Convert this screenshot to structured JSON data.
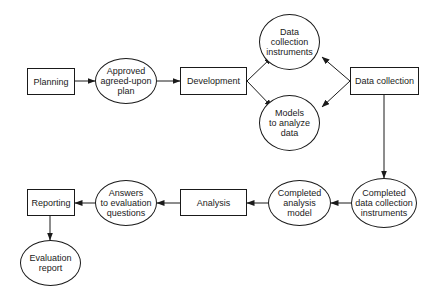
{
  "diagram": {
    "type": "flowchart",
    "colors": {
      "stroke": "#1a1a1a",
      "background": "#ffffff"
    },
    "nodes": [
      {
        "id": "planning",
        "shape": "box",
        "label": "Planning"
      },
      {
        "id": "approved_plan",
        "shape": "ellipse",
        "label": "Approved\nagreed-upon\nplan"
      },
      {
        "id": "development",
        "shape": "box",
        "label": "Development"
      },
      {
        "id": "data_instruments",
        "shape": "ellipse",
        "label": "Data\ncollection\ninstruments"
      },
      {
        "id": "models",
        "shape": "ellipse",
        "label": "Models\nto analyze\ndata"
      },
      {
        "id": "data_collection",
        "shape": "box",
        "label": "Data collection"
      },
      {
        "id": "completed_instruments",
        "shape": "ellipse",
        "label": "Completed\ndata collection\ninstruments"
      },
      {
        "id": "completed_model",
        "shape": "ellipse",
        "label": "Completed\nanalysis\nmodel"
      },
      {
        "id": "analysis",
        "shape": "box",
        "label": "Analysis"
      },
      {
        "id": "answers",
        "shape": "ellipse",
        "label": "Answers\nto evaluation\nquestions"
      },
      {
        "id": "reporting",
        "shape": "box",
        "label": "Reporting"
      },
      {
        "id": "evaluation_report",
        "shape": "ellipse",
        "label": "Evaluation\nreport"
      }
    ],
    "edges": [
      {
        "from": "planning",
        "to": "approved_plan"
      },
      {
        "from": "approved_plan",
        "to": "development"
      },
      {
        "from": "development",
        "to": "data_instruments"
      },
      {
        "from": "development",
        "to": "models"
      },
      {
        "from": "data_collection",
        "to": "data_instruments"
      },
      {
        "from": "data_collection",
        "to": "models"
      },
      {
        "from": "data_collection",
        "to": "completed_instruments"
      },
      {
        "from": "completed_instruments",
        "to": "completed_model"
      },
      {
        "from": "completed_model",
        "to": "analysis"
      },
      {
        "from": "analysis",
        "to": "answers"
      },
      {
        "from": "answers",
        "to": "reporting"
      },
      {
        "from": "reporting",
        "to": "evaluation_report"
      }
    ]
  }
}
